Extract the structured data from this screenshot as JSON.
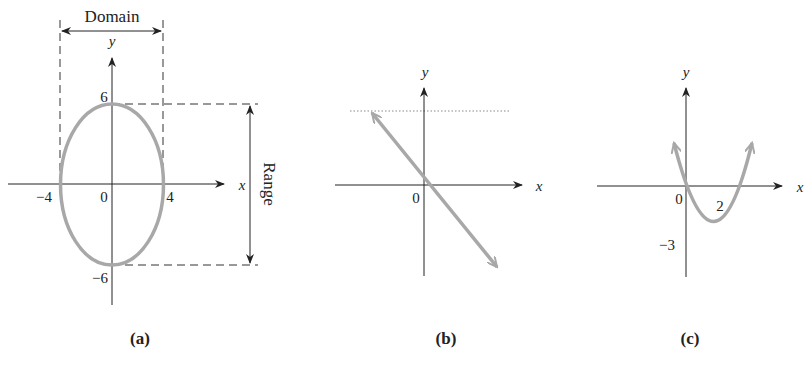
{
  "figure": {
    "panels": [
      {
        "id": "a",
        "caption": "(a)",
        "curve": "ellipse",
        "x_axis_label": "x",
        "y_axis_label": "y",
        "origin_label": "0",
        "tick_labels": {
          "x_neg": "−4",
          "x_pos": "4",
          "y_pos": "6",
          "y_neg": "−6"
        },
        "domain_label": "Domain",
        "range_label": "Range"
      },
      {
        "id": "b",
        "caption": "(b)",
        "curve": "line",
        "x_axis_label": "x",
        "y_axis_label": "y",
        "origin_label": "0"
      },
      {
        "id": "c",
        "caption": "(c)",
        "curve": "parabola",
        "x_axis_label": "x",
        "y_axis_label": "y",
        "origin_label": "0",
        "tick_labels": {
          "x_pos": "2",
          "y_neg": "−3"
        }
      }
    ],
    "colors": {
      "axis": "#222222",
      "curve": "#a8a8a8",
      "guide": "#333333"
    }
  }
}
